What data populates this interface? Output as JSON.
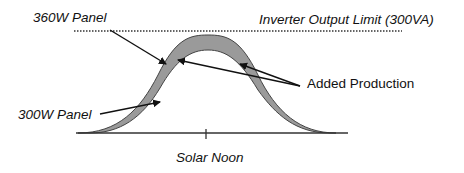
{
  "diagram": {
    "labels": {
      "panel_360w": "360W Panel",
      "panel_300w": "300W Panel",
      "inverter_limit": "Inverter Output Limit (300VA)",
      "added_production": "Added Production",
      "solar_noon": "Solar Noon"
    },
    "colors": {
      "band_fill": "#9a9a9a",
      "outline": "#333333",
      "text": "#111111"
    }
  }
}
